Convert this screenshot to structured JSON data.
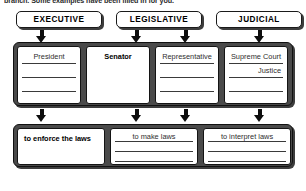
{
  "instruction": "branch. Some examples have been filled in for you.",
  "headers": [
    {
      "label": "EXECUTIVE"
    },
    {
      "label": "LEGISLATIVE"
    },
    {
      "label": "JUDICIAL"
    }
  ],
  "arrows": {
    "icon_name": "down-arrow-icon",
    "top_count": 4,
    "middle_count": 4
  },
  "roles_row": {
    "cells": [
      {
        "style": "ruled",
        "lines": [
          {
            "text": "President",
            "align": "center",
            "filled": false
          },
          {
            "text": "",
            "align": "center",
            "filled": false
          },
          {
            "text": "",
            "align": "center",
            "filled": false
          }
        ]
      },
      {
        "style": "plain",
        "lines": [
          {
            "text": "Senator",
            "align": "center",
            "filled": true
          }
        ]
      },
      {
        "style": "ruled",
        "lines": [
          {
            "text": "Representative",
            "align": "center",
            "filled": false
          },
          {
            "text": "",
            "align": "center",
            "filled": false
          },
          {
            "text": "",
            "align": "center",
            "filled": false
          }
        ]
      },
      {
        "style": "ruled",
        "lines": [
          {
            "text": "Supreme Court",
            "align": "center",
            "filled": false
          },
          {
            "text": "Justice",
            "align": "right",
            "filled": false
          },
          {
            "text": "",
            "align": "center",
            "filled": false
          }
        ]
      }
    ]
  },
  "powers_row": {
    "cells": [
      {
        "style": "plain",
        "lines": [
          {
            "text": "to enforce the laws",
            "align": "left",
            "filled": true
          }
        ]
      },
      {
        "style": "ruled",
        "lines": [
          {
            "text": "to make laws",
            "align": "center",
            "filled": false
          },
          {
            "text": "",
            "align": "center",
            "filled": false
          },
          {
            "text": "",
            "align": "center",
            "filled": false
          }
        ]
      },
      {
        "style": "ruled",
        "lines": [
          {
            "text": "to interpret laws",
            "align": "center",
            "filled": false
          },
          {
            "text": "",
            "align": "center",
            "filled": false
          },
          {
            "text": "",
            "align": "center",
            "filled": false
          }
        ]
      }
    ]
  },
  "colors": {
    "frame_fill": "#4a4a4a",
    "frame_border": "#111111",
    "cell_fill": "#ffffff",
    "rule_line": "#3a3a3a",
    "text": "#000000"
  }
}
